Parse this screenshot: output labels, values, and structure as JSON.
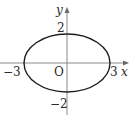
{
  "diagram": {
    "type": "ellipse-on-coordinate-axes",
    "equation_semantics": "ellipse centered at origin, semi-axes 3 (x) and 2 (y)",
    "axes": {
      "x_label": "x",
      "y_label": "y",
      "origin_label": "O"
    },
    "ticks": {
      "x_neg": "−3",
      "x_pos": "3",
      "y_pos": "2",
      "y_neg": "−2"
    },
    "ellipse": {
      "center": [
        0,
        0
      ],
      "semi_axis_x": 3,
      "semi_axis_y": 2
    },
    "colors": {
      "curve": "#1e1e1e",
      "axis": "#8a8a8a",
      "text": "#2a2a2a"
    }
  }
}
